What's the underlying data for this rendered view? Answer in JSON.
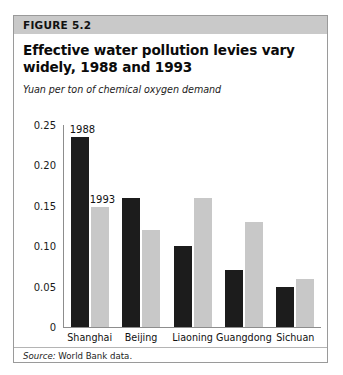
{
  "figure": {
    "band_label": "FIGURE 5.2",
    "title": "Effective water pollution levies vary widely, 1988 and 1993",
    "subtitle": "Yuan per ton of chemical oxygen demand",
    "source_prefix": "Source:",
    "source_text": "World Bank data."
  },
  "colors": {
    "series_1988": "#1c1c1c",
    "series_1993": "#c8c8c8",
    "band": "#c9c9c9",
    "border": "#9a9a9a",
    "axis": "#8d8d8d"
  },
  "annotations": {
    "label_1988": "1988",
    "label_1993": "1993"
  },
  "chart_data": {
    "type": "bar",
    "title": "Effective water pollution levies vary widely, 1988 and 1993",
    "subtitle": "Yuan per ton of chemical oxygen demand",
    "xlabel": "",
    "ylabel": "Yuan per ton of chemical oxygen demand",
    "ylim": [
      0,
      0.25
    ],
    "yticks": [
      0,
      0.05,
      0.1,
      0.15,
      0.2,
      0.25
    ],
    "ytick_labels": [
      "0",
      "0.05",
      "0.10",
      "0.15",
      "0.20",
      "0.25"
    ],
    "grid": false,
    "legend": "in-plot annotations above first group bars",
    "categories": [
      "Shanghai",
      "Beijing",
      "Liaoning",
      "Guangdong",
      "Sichuan"
    ],
    "series": [
      {
        "name": "1988",
        "color": "#1c1c1c",
        "values": [
          0.235,
          0.16,
          0.1,
          0.07,
          0.05
        ]
      },
      {
        "name": "1993",
        "color": "#c8c8c8",
        "values": [
          0.148,
          0.12,
          0.16,
          0.13,
          0.06
        ]
      }
    ]
  }
}
